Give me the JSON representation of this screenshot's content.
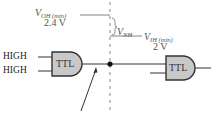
{
  "diagram": {
    "labels": {
      "voh": {
        "main": "V",
        "sub": "OH (min)",
        "value": "2.4 V"
      },
      "vnh": {
        "main": "V",
        "sub": "NH"
      },
      "vih": {
        "main": "V",
        "sub": "IH (min)",
        "value": "2 V"
      }
    },
    "inputs": [
      "HIGH",
      "HIGH"
    ],
    "gates": [
      {
        "label": "TTL",
        "role": "driving gate"
      },
      {
        "label": "TTL",
        "role": "load gate"
      }
    ],
    "colors": {
      "gate_fill": "#c8c8c8",
      "line": "#333333",
      "dashed": "#888888",
      "text": "#555555"
    }
  }
}
